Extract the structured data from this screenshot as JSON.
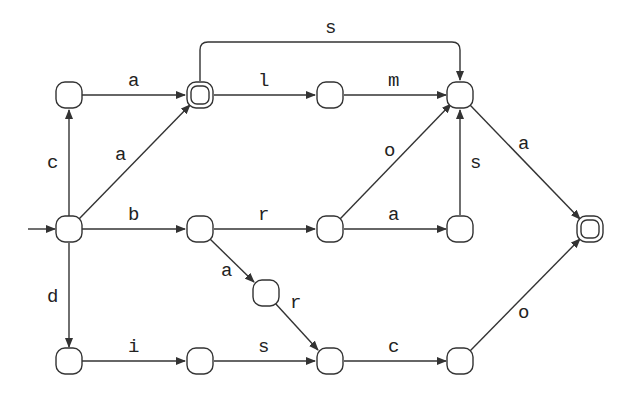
{
  "diagram": {
    "type": "finite-state-automaton",
    "colors": {
      "stroke": "#333333",
      "text": "#222222",
      "background": "#ffffff"
    },
    "start_state": "n5",
    "accepting_states": [
      "n2",
      "n9"
    ],
    "nodes": [
      {
        "id": "n1",
        "x": 69,
        "y": 95,
        "accepting": false
      },
      {
        "id": "n2",
        "x": 200,
        "y": 95,
        "accepting": true
      },
      {
        "id": "n3",
        "x": 330,
        "y": 95,
        "accepting": false
      },
      {
        "id": "n4",
        "x": 460,
        "y": 95,
        "accepting": false
      },
      {
        "id": "n5",
        "x": 69,
        "y": 229,
        "accepting": false,
        "start": true
      },
      {
        "id": "n6",
        "x": 200,
        "y": 229,
        "accepting": false
      },
      {
        "id": "n7",
        "x": 330,
        "y": 229,
        "accepting": false
      },
      {
        "id": "n8",
        "x": 460,
        "y": 229,
        "accepting": false
      },
      {
        "id": "n9",
        "x": 590,
        "y": 229,
        "accepting": true
      },
      {
        "id": "n10",
        "x": 266,
        "y": 293,
        "accepting": false
      },
      {
        "id": "n11",
        "x": 69,
        "y": 361,
        "accepting": false
      },
      {
        "id": "n12",
        "x": 200,
        "y": 361,
        "accepting": false
      },
      {
        "id": "n13",
        "x": 330,
        "y": 361,
        "accepting": false
      },
      {
        "id": "n14",
        "x": 460,
        "y": 361,
        "accepting": false
      }
    ],
    "edges": [
      {
        "from": "n1",
        "to": "n2",
        "label": "a"
      },
      {
        "from": "n5",
        "to": "n1",
        "label": "c"
      },
      {
        "from": "n5",
        "to": "n2",
        "label": "a"
      },
      {
        "from": "n2",
        "to": "n3",
        "label": "l"
      },
      {
        "from": "n2",
        "to": "n4",
        "label": "s"
      },
      {
        "from": "n3",
        "to": "n4",
        "label": "m"
      },
      {
        "from": "n7",
        "to": "n4",
        "label": "o"
      },
      {
        "from": "n8",
        "to": "n4",
        "label": "s"
      },
      {
        "from": "n4",
        "to": "n9",
        "label": "a"
      },
      {
        "from": "n5",
        "to": "n6",
        "label": "b"
      },
      {
        "from": "n6",
        "to": "n7",
        "label": "r"
      },
      {
        "from": "n7",
        "to": "n8",
        "label": "a"
      },
      {
        "from": "n6",
        "to": "n10",
        "label": "a"
      },
      {
        "from": "n10",
        "to": "n13",
        "label": "r"
      },
      {
        "from": "n5",
        "to": "n11",
        "label": "d"
      },
      {
        "from": "n11",
        "to": "n12",
        "label": "i"
      },
      {
        "from": "n12",
        "to": "n13",
        "label": "s"
      },
      {
        "from": "n13",
        "to": "n14",
        "label": "c"
      },
      {
        "from": "n14",
        "to": "n9",
        "label": "o"
      }
    ]
  }
}
